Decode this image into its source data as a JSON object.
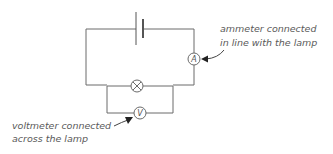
{
  "diagram": {
    "type": "circuit",
    "components": {
      "battery": {
        "name": "cell"
      },
      "ammeter": {
        "symbol": "A"
      },
      "lamp": {
        "symbol": "⊗"
      },
      "voltmeter": {
        "symbol": "V"
      }
    },
    "labels": {
      "ammeter": [
        "ammeter connected",
        "in line with the lamp"
      ],
      "voltmeter": [
        "voltmeter connected",
        "across the lamp"
      ]
    },
    "colors": {
      "wire": "#6b6b6b",
      "text": "#5a5a5a",
      "arrow": "#222222"
    }
  }
}
